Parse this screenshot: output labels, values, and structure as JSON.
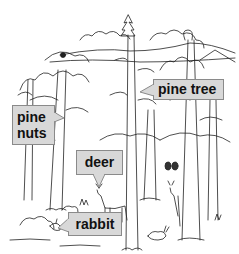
{
  "diagram": {
    "labels": [
      {
        "id": "pine-tree",
        "text": "pine tree"
      },
      {
        "id": "pine-nuts",
        "text": "pine\nnuts",
        "lines": [
          "pine",
          "nuts"
        ]
      },
      {
        "id": "deer",
        "text": "deer"
      },
      {
        "id": "rabbit",
        "text": "rabbit"
      }
    ],
    "colors": {
      "label_fill": "#d8d8d8",
      "label_border": "#8a8a8a",
      "text": "#111111",
      "line_art": "#222222"
    }
  }
}
